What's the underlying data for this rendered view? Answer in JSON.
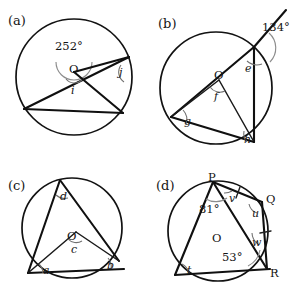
{
  "figure": {
    "type": "geometry-diagram-set",
    "background_color": "#ffffff",
    "line_color": "#101010",
    "arc_mark_color": "#8d8d8d"
  },
  "panels": [
    {
      "tag": "(a)",
      "center_label": "O",
      "angles": [
        {
          "name": "reflex-angle",
          "label": "252°"
        },
        {
          "name": "angle-i",
          "label": "i"
        },
        {
          "name": "angle-j",
          "label": "j"
        }
      ]
    },
    {
      "tag": "(b)",
      "center_label": "O",
      "angles": [
        {
          "name": "exterior-angle",
          "label": "134°"
        },
        {
          "name": "angle-e",
          "label": "e"
        },
        {
          "name": "angle-f",
          "label": "f"
        },
        {
          "name": "angle-g",
          "label": "g"
        },
        {
          "name": "angle-h",
          "label": "h"
        }
      ]
    },
    {
      "tag": "(c)",
      "center_label": "O",
      "angles": [
        {
          "name": "angle-a",
          "label": "a"
        },
        {
          "name": "angle-b",
          "label": "b"
        },
        {
          "name": "angle-c",
          "label": "c"
        },
        {
          "name": "angle-d",
          "label": "d"
        }
      ]
    },
    {
      "tag": "(d)",
      "center_label": "O",
      "vertices": [
        {
          "name": "vertex-p",
          "label": "P"
        },
        {
          "name": "vertex-q",
          "label": "Q"
        },
        {
          "name": "vertex-r",
          "label": "R"
        }
      ],
      "angles": [
        {
          "name": "angle-81",
          "label": "81°"
        },
        {
          "name": "angle-53",
          "label": "53°"
        },
        {
          "name": "angle-t",
          "label": "t"
        },
        {
          "name": "angle-u",
          "label": "u"
        },
        {
          "name": "angle-v",
          "label": "v"
        },
        {
          "name": "angle-w",
          "label": "w"
        }
      ]
    }
  ]
}
